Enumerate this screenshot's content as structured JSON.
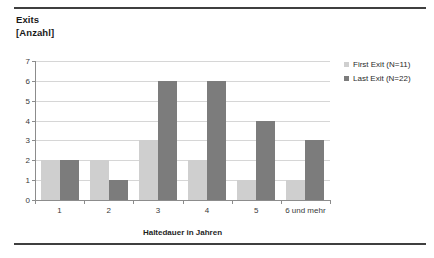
{
  "title": {
    "line1": "Exits",
    "line2": "[Anzahl]"
  },
  "axis": {
    "x_title": "Haltedauer in Jahren",
    "y_ticks": [
      "7",
      "6",
      "5",
      "4",
      "3",
      "2",
      "1",
      "0"
    ]
  },
  "legend": [
    {
      "label": "First Exit (N=11)",
      "color": "#cfcfcf",
      "swatch_name": "legend-swatch-first-exit"
    },
    {
      "label": "Last Exit (N=22)",
      "color": "#7c7c7c",
      "swatch_name": "legend-swatch-last-exit"
    }
  ],
  "colors": {
    "first_exit": "#cfcfcf",
    "last_exit": "#7c7c7c",
    "gridline": "#d6d6d6",
    "axis": "#8c8c8c",
    "rule": "#3f3f3f",
    "text": "#1a1a1a",
    "background": "#ffffff"
  },
  "chart_data": {
    "type": "bar",
    "title": "Exits [Anzahl]",
    "xlabel": "Haltedauer in Jahren",
    "ylabel": "Exits [Anzahl]",
    "categories": [
      "1",
      "2",
      "3",
      "4",
      "5",
      "6 und mehr"
    ],
    "series": [
      {
        "name": "First Exit (N=11)",
        "color": "#cfcfcf",
        "values": [
          2,
          2,
          3,
          2,
          1,
          1
        ]
      },
      {
        "name": "Last Exit (N=22)",
        "color": "#7c7c7c",
        "values": [
          2,
          1,
          6,
          6,
          4,
          3
        ]
      }
    ],
    "ylim": [
      0,
      7
    ],
    "yticks": [
      0,
      1,
      2,
      3,
      4,
      5,
      6,
      7
    ],
    "grid": true,
    "legend_position": "right"
  }
}
